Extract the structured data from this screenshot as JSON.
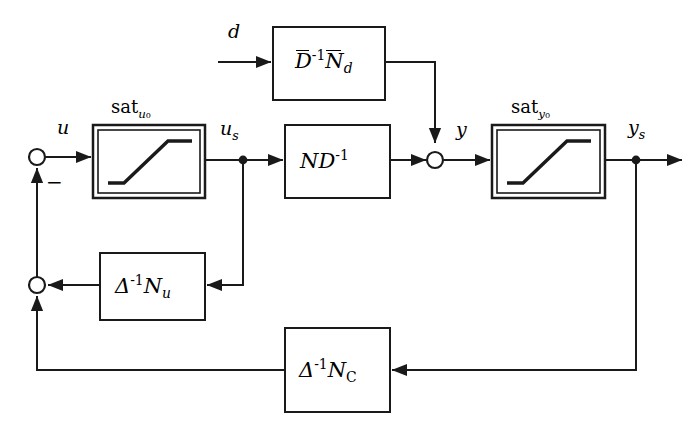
{
  "diagram": {
    "type": "block-diagram",
    "canvas": {
      "width": 698,
      "height": 427
    },
    "stroke_color": "#1a1a1a",
    "background_color": "#ffffff"
  },
  "blocks": [
    {
      "id": "sat_u0",
      "name": "input-saturation-block",
      "caption": "sat",
      "caption_sub": "u",
      "caption_sub2": "0",
      "border": "double",
      "content": "saturation-curve",
      "x": 93,
      "y": 125,
      "w": 112,
      "h": 73
    },
    {
      "id": "plant",
      "name": "plant-block",
      "label_main": "ND",
      "label_exp": "-1",
      "border": "single",
      "x": 285,
      "y": 125,
      "w": 105,
      "h": 73
    },
    {
      "id": "disturbance",
      "name": "disturbance-model-block",
      "label_d1": "D",
      "label_exp": "-1",
      "label_n": "N",
      "label_nsub": "d",
      "border": "single",
      "x": 273,
      "y": 27,
      "w": 112,
      "h": 73
    },
    {
      "id": "sat_y0",
      "name": "output-saturation-block",
      "caption": "sat",
      "caption_sub": "y",
      "caption_sub2": "0",
      "border": "double",
      "content": "saturation-curve",
      "x": 492,
      "y": 125,
      "w": 113,
      "h": 73
    },
    {
      "id": "nu",
      "name": "anti-windup-nu-block",
      "label_delta": "Δ",
      "label_exp": "-1",
      "label_n": "N",
      "label_nsub": "u",
      "border": "single",
      "x": 100,
      "y": 253,
      "w": 105,
      "h": 67
    },
    {
      "id": "nc",
      "name": "controller-nc-block",
      "label_delta": "Δ",
      "label_exp": "-1",
      "label_n": "N",
      "label_nsub": "C",
      "border": "single",
      "x": 285,
      "y": 328,
      "w": 105,
      "h": 84
    }
  ],
  "nodes": [
    {
      "id": "sum1",
      "name": "summing-junction-input",
      "x": 37,
      "y": 157,
      "r": 8
    },
    {
      "id": "sum2",
      "name": "summing-junction-feedback",
      "x": 37,
      "y": 285,
      "r": 8
    },
    {
      "id": "sum3",
      "name": "summing-junction-output",
      "x": 435,
      "y": 160,
      "r": 8
    },
    {
      "id": "dot_us",
      "name": "branch-point-us",
      "x": 243,
      "y": 160,
      "r": 4
    },
    {
      "id": "dot_ys",
      "name": "branch-point-ys",
      "x": 636,
      "y": 160,
      "r": 4
    }
  ],
  "signals": {
    "u": {
      "text": "u",
      "x": 57,
      "y": 118
    },
    "u_s": {
      "base": "u",
      "sub": "s",
      "x": 220,
      "y": 119
    },
    "y": {
      "text": "y",
      "x": 456,
      "y": 120
    },
    "y_s": {
      "base": "y",
      "sub": "s",
      "x": 628,
      "y": 118
    },
    "d": {
      "text": "d",
      "x": 228,
      "y": 22
    },
    "minus": {
      "text": "−",
      "x": 46,
      "y": 175
    }
  },
  "captions": {
    "sat_u0": {
      "base": "sat",
      "sub": "u",
      "sub2": "0",
      "x": 111,
      "y": 98
    },
    "sat_y0": {
      "base": "sat",
      "sub": "y",
      "sub2": "0",
      "x": 511,
      "y": 98
    }
  },
  "edges": [
    {
      "name": "edge-sum1-to-satu0",
      "from": "sum1",
      "to": "sat_u0",
      "arrow": true
    },
    {
      "name": "edge-satu0-to-us",
      "from": "sat_u0",
      "to": "dot_us",
      "arrow": false
    },
    {
      "name": "edge-us-to-plant",
      "from": "dot_us",
      "to": "plant",
      "arrow": true
    },
    {
      "name": "edge-plant-to-sum3",
      "from": "plant",
      "to": "sum3",
      "arrow": true
    },
    {
      "name": "edge-d-to-disturbance",
      "from": "d-input",
      "to": "disturbance",
      "arrow": true
    },
    {
      "name": "edge-disturbance-to-sum3",
      "from": "disturbance",
      "to": "sum3",
      "arrow": true
    },
    {
      "name": "edge-sum3-to-saty0",
      "from": "sum3",
      "to": "sat_y0",
      "arrow": true
    },
    {
      "name": "edge-saty0-to-ys",
      "from": "sat_y0",
      "to": "dot_ys",
      "arrow": false
    },
    {
      "name": "edge-ys-to-output",
      "from": "dot_ys",
      "to": "output",
      "arrow": true
    },
    {
      "name": "edge-us-to-nu",
      "from": "dot_us",
      "to": "nu",
      "arrow": true
    },
    {
      "name": "edge-nu-to-sum2",
      "from": "nu",
      "to": "sum2",
      "arrow": true
    },
    {
      "name": "edge-ys-to-nc",
      "from": "dot_ys",
      "to": "nc",
      "arrow": true
    },
    {
      "name": "edge-nc-to-sum2",
      "from": "nc",
      "to": "sum2",
      "arrow": true
    },
    {
      "name": "edge-sum2-to-sum1",
      "from": "sum2",
      "to": "sum1",
      "arrow": true
    }
  ]
}
